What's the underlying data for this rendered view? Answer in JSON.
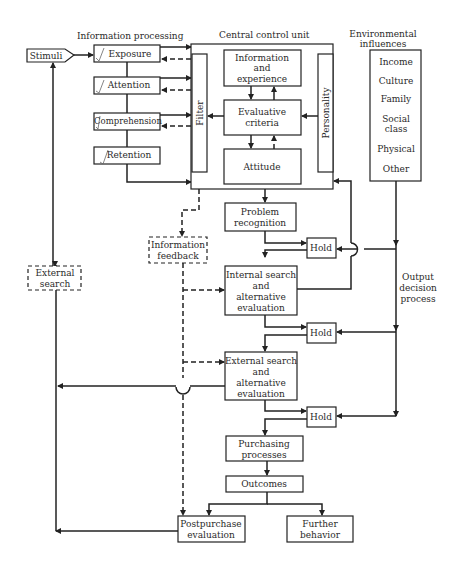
{
  "diagram": {
    "labels": {
      "information_processing": "Information processing",
      "central_control_unit": "Central control unit",
      "environmental_influences": [
        "Environmental",
        "influences"
      ],
      "output_decision_process": [
        "Output",
        "decision",
        "process"
      ]
    },
    "stimuli": "Stimuli",
    "info_steps": [
      "Exposure",
      "Attention",
      "Comprehension",
      "Retention"
    ],
    "ccu": {
      "filter": "Filter",
      "personality": "Personality",
      "info_experience": [
        "Information",
        "and",
        "experience"
      ],
      "evaluative_criteria": [
        "Evaluative",
        "criteria"
      ],
      "attitude": "Attitude"
    },
    "environment": [
      "Income",
      "Culture",
      "Family",
      [
        "Social",
        "class"
      ],
      "Physical",
      "Other"
    ],
    "external_search_box": [
      "External",
      "search"
    ],
    "information_feedback": [
      "Information",
      "feedback"
    ],
    "decision_steps": {
      "problem_recognition": [
        "Problem",
        "recognition"
      ],
      "internal_search": [
        "Internal search",
        "and",
        "alternative",
        "evaluation"
      ],
      "external_search": [
        "External search",
        "and",
        "alternative",
        "evaluation"
      ],
      "purchasing": [
        "Purchasing",
        "processes"
      ],
      "outcomes": "Outcomes",
      "postpurchase": [
        "Postpurchase",
        "evaluation"
      ],
      "further_behavior": [
        "Further",
        "behavior"
      ]
    },
    "hold": [
      "Hold",
      "Hold",
      "Hold"
    ]
  }
}
